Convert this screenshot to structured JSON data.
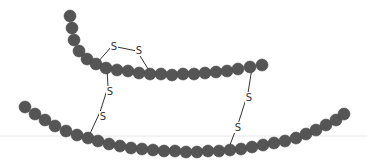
{
  "diagram": {
    "colors": {
      "bead": "#555555",
      "bead_edge": "#4a4a4a",
      "bond": "#333333",
      "baseline": "#e6e6e6",
      "background": "#ffffff"
    },
    "bead_radius": 6,
    "chains": [
      {
        "name": "upper-chain",
        "beads": [
          [
            70,
            16
          ],
          [
            72,
            28
          ],
          [
            74,
            40
          ],
          [
            79,
            51
          ],
          [
            87,
            59
          ],
          [
            96,
            64
          ],
          [
            106,
            68
          ],
          [
            117,
            70
          ],
          [
            128,
            71
          ],
          [
            139,
            73
          ],
          [
            150,
            74
          ],
          [
            161,
            74
          ],
          [
            172,
            75
          ],
          [
            183,
            74
          ],
          [
            194,
            74
          ],
          [
            205,
            73
          ],
          [
            216,
            72
          ],
          [
            227,
            71
          ],
          [
            238,
            69
          ],
          [
            250,
            67
          ],
          [
            262,
            65
          ]
        ]
      },
      {
        "name": "lower-chain",
        "beads": [
          [
            25,
            107
          ],
          [
            35,
            114
          ],
          [
            45,
            120
          ],
          [
            55,
            126
          ],
          [
            66,
            131
          ],
          [
            77,
            135
          ],
          [
            88,
            138
          ],
          [
            98,
            141
          ],
          [
            109,
            144
          ],
          [
            120,
            146
          ],
          [
            131,
            148
          ],
          [
            142,
            149
          ],
          [
            153,
            150
          ],
          [
            164,
            151
          ],
          [
            175,
            151
          ],
          [
            186,
            152
          ],
          [
            197,
            152
          ],
          [
            208,
            151
          ],
          [
            219,
            151
          ],
          [
            230,
            150
          ],
          [
            241,
            149
          ],
          [
            252,
            147
          ],
          [
            263,
            145
          ],
          [
            274,
            143
          ],
          [
            285,
            141
          ],
          [
            296,
            138
          ],
          [
            306,
            134
          ],
          [
            316,
            130
          ],
          [
            326,
            125
          ],
          [
            336,
            120
          ],
          [
            344,
            114
          ]
        ]
      }
    ],
    "bridges": [
      {
        "name": "intrachain-bridge",
        "labels": [
          "S",
          "S"
        ],
        "points": [
          [
            97,
            63
          ],
          [
            112,
            46
          ],
          [
            137,
            51
          ],
          [
            150,
            72
          ]
        ],
        "label_pos": [
          [
            114,
            50
          ],
          [
            139,
            54
          ]
        ]
      },
      {
        "name": "left-interchain-bridge",
        "labels": [
          "S",
          "S"
        ],
        "points": [
          [
            107,
            69
          ],
          [
            108,
            87
          ],
          [
            100,
            112
          ],
          [
            88,
            138
          ]
        ],
        "label_pos": [
          [
            110,
            95
          ],
          [
            103,
            120
          ]
        ]
      },
      {
        "name": "right-interchain-bridge",
        "labels": [
          "S",
          "S"
        ],
        "points": [
          [
            252,
            68
          ],
          [
            248,
            93
          ],
          [
            238,
            124
          ],
          [
            228,
            150
          ]
        ],
        "label_pos": [
          [
            249,
            101
          ],
          [
            238,
            131
          ]
        ]
      }
    ],
    "baseline_y": 136
  }
}
